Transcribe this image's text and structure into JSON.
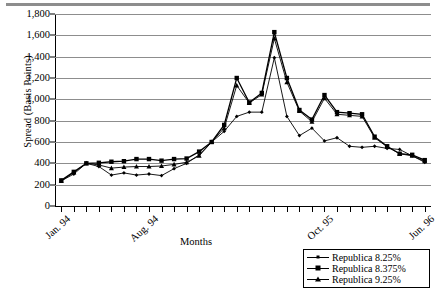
{
  "chart_data": {
    "type": "line",
    "title": "",
    "xlabel": "Months",
    "ylabel": "Spread (Basis Points)",
    "ylim": [
      0,
      1800
    ],
    "ytick_labels": [
      "0",
      "200",
      "400",
      "600",
      "800",
      "1,000",
      "1,200",
      "1,400",
      "1,600",
      "1,800"
    ],
    "ytick_values": [
      0,
      200,
      400,
      600,
      800,
      1000,
      1200,
      1400,
      1600,
      1800
    ],
    "grid": true,
    "legend_position": "bottom-right",
    "x_tick_count": 30,
    "xtick_labels": [
      {
        "index": 0,
        "label": "Jan. 94"
      },
      {
        "index": 7,
        "label": "Aug. 94"
      },
      {
        "index": 21,
        "label": "Oct. 95"
      },
      {
        "index": 29,
        "label": "Jun. 96"
      }
    ],
    "x": [
      0,
      1,
      2,
      3,
      4,
      5,
      6,
      7,
      8,
      9,
      10,
      11,
      12,
      13,
      14,
      15,
      16,
      17,
      18,
      19,
      20,
      21,
      22,
      23,
      24,
      25,
      26,
      27,
      28,
      29
    ],
    "series": [
      {
        "name": "Republica 8.25%",
        "marker": "diamond",
        "values": [
          235,
          300,
          400,
          370,
          290,
          310,
          290,
          300,
          285,
          350,
          400,
          480,
          600,
          700,
          840,
          880,
          880,
          1390,
          840,
          660,
          730,
          610,
          640,
          560,
          550,
          560,
          540,
          530,
          470,
          410
        ]
      },
      {
        "name": "Republica 8.375%",
        "marker": "square",
        "values": [
          240,
          320,
          400,
          405,
          415,
          420,
          440,
          440,
          425,
          440,
          445,
          510,
          600,
          760,
          1200,
          970,
          1060,
          1630,
          1200,
          900,
          810,
          1040,
          880,
          870,
          860,
          650,
          560,
          490,
          480,
          430
        ]
      },
      {
        "name": "Republica 9.25%",
        "marker": "triangle",
        "values": [
          235,
          315,
          400,
          385,
          355,
          365,
          370,
          370,
          375,
          390,
          410,
          470,
          600,
          730,
          1130,
          965,
          1045,
          1570,
          1160,
          890,
          790,
          1010,
          860,
          850,
          840,
          640,
          555,
          490,
          470,
          420
        ]
      }
    ]
  },
  "legend": {
    "items": [
      {
        "label": "Republica 8.25%",
        "marker": "diamond"
      },
      {
        "label": "Republica 8.375%",
        "marker": "square"
      },
      {
        "label": "Republica 9.25%",
        "marker": "triangle"
      }
    ]
  },
  "colors": {
    "line": "#000000",
    "grid": "#8d8d8d",
    "axis": "#000000",
    "background": "#ffffff"
  }
}
